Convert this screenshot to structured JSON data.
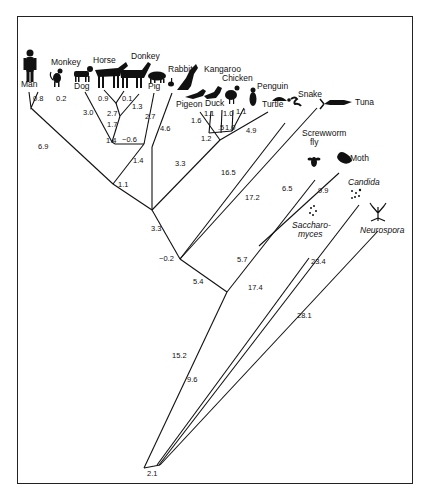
{
  "diagram": {
    "type": "phylogenetic-tree"
  },
  "taxa": {
    "man": "Man",
    "monkey": "Monkey",
    "dog": "Dog",
    "horse": "Horse",
    "donkey": "Donkey",
    "pig": "Pig",
    "rabbit": "Rabbit",
    "kangaroo": "Kangaroo",
    "pigeon": "Pigeon",
    "duck": "Duck",
    "chicken": "Chicken",
    "penguin": "Penguin",
    "turtle": "Turtle",
    "snake": "Snake",
    "tuna": "Tuna",
    "screwworm_1": "Screwworm",
    "screwworm_2": "fly",
    "moth": "Moth",
    "candida": "Candida",
    "sacch_1": "Saccharo-",
    "sacch_2": "myces",
    "neurospora": "Neurospora"
  },
  "branch_lengths": {
    "man": "0.8",
    "monkey": "0.2",
    "primates_stem": "6.9",
    "dog": "3.0",
    "horse": "0.9",
    "donkey": "0.1",
    "horse_donkey_stem": "2.7",
    "pig": "1.3",
    "ungulate_stem": "1.7",
    "dog_ungulate_node": "1.4",
    "rabbit": "2.7",
    "neg": "−0.6",
    "kangaroo": "4.6",
    "placental_stem": "1.4",
    "mammal_node": "1.1",
    "pigeon": "1.6",
    "duck": "1.1",
    "chicken": "1.0",
    "penguin": "1.1",
    "galliform_stem": "1.0",
    "bird_inner": ".5",
    "bird_stem": "1.2",
    "turtle": "4.9",
    "reptile_bird_stem": "3.3",
    "amniote_stem": "3.3",
    "snake": "16.5",
    "tuna": "17.2",
    "vertebrate_node": "−0.2",
    "screwworm": "6.5",
    "moth": "9.9",
    "insect_stem": "5.7",
    "animal_stem": "5.4",
    "animal_root": "15.2",
    "saccharomyces": "17.4",
    "candida": "23.4",
    "fungus_stem": "9.6",
    "neurospora": "28.1",
    "root": "2.1"
  }
}
